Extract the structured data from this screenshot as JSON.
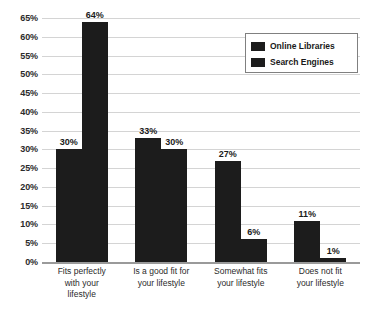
{
  "chart_data": {
    "type": "bar",
    "title": "",
    "subtitle": "",
    "xlabel": "",
    "ylabel": "",
    "ylim": [
      0,
      65
    ],
    "grid": true,
    "legend_position": "top-right",
    "categories": [
      "Fits perfectly with your lifestyle",
      "Is a good fit for your lifestyle",
      "Somewhat fits your lifestyle",
      "Does not fit your lifestyle"
    ],
    "category_lines": [
      [
        "Fits perfectly",
        "with your",
        "lifestyle"
      ],
      [
        "Is a good fit for",
        "your lifestyle"
      ],
      [
        "Somewhat fits",
        "your lifestyle"
      ],
      [
        "Does not fit",
        "your lifestyle"
      ]
    ],
    "series": [
      {
        "name": "Online Libraries",
        "color": "#1c1c1c",
        "values": [
          30,
          33,
          27,
          11
        ],
        "labels": [
          "30%",
          "33%",
          "27%",
          "11%"
        ]
      },
      {
        "name": "Search Engines",
        "color": "#1c1c1c",
        "values": [
          64,
          30,
          6,
          1
        ],
        "labels": [
          "64%",
          "30%",
          "6%",
          "1%"
        ]
      }
    ],
    "yticks": [
      0,
      5,
      10,
      15,
      20,
      25,
      30,
      35,
      40,
      45,
      50,
      55,
      60,
      65
    ],
    "ytick_labels": [
      "0%",
      "5%",
      "10%",
      "15%",
      "20%",
      "25%",
      "30%",
      "35%",
      "40%",
      "45%",
      "50%",
      "55%",
      "60%",
      "65%"
    ]
  },
  "legend": {
    "items": [
      {
        "label": "Online Libraries",
        "color": "#1c1c1c"
      },
      {
        "label": "Search Engines",
        "color": "#1c1c1c"
      }
    ]
  },
  "colors": {
    "bar": "#1c1c1c",
    "gridline": "#d4d4d4",
    "axis": "#9a9a9a",
    "text": "#2b2b2b",
    "background": "#ffffff"
  }
}
